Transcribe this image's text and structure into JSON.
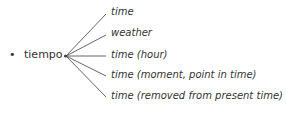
{
  "root": {
    "bullet": "•",
    "word": "tiempo"
  },
  "branches": [
    {
      "label": "time",
      "y": 13
    },
    {
      "label": "weather",
      "y": 34
    },
    {
      "label": "time (hour)",
      "y": 56
    },
    {
      "label": "time (moment, point in time)",
      "y": 76
    },
    {
      "label": "time (removed from present time)",
      "y": 97
    }
  ]
}
